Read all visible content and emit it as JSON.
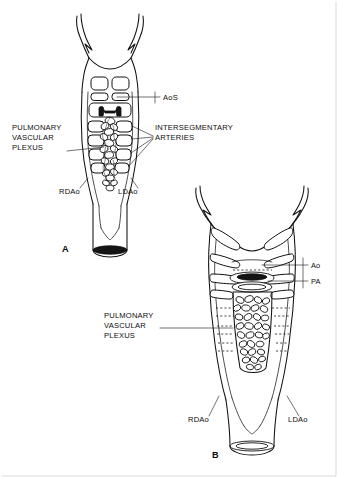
{
  "figure": {
    "type": "anatomical-line-diagram",
    "background_color": "#ffffff",
    "ink_color": "#101010",
    "width": 338,
    "height": 478
  },
  "panels": [
    {
      "id": "A",
      "letter": "A",
      "letter_x": 62,
      "letter_y": 252,
      "description": "Earlier stage: aortic sac with paired dorsal aortae and developing pulmonary vascular plexus",
      "labels": [
        {
          "name": "aortic-sac",
          "text": "AoS",
          "x": 163,
          "y": 100,
          "anchor": "start",
          "lines": [
            "AoS"
          ]
        },
        {
          "name": "pulmonary-vascular-plexus",
          "text": "PULMONARY VASCULAR PLEXUS",
          "x": 12,
          "y": 130,
          "anchor": "start",
          "lines": [
            "PULMONARY",
            "VASCULAR",
            "PLEXUS"
          ]
        },
        {
          "name": "intersegmentary-arteries",
          "text": "INTERSEGMENTARY ARTERIES",
          "x": 155,
          "y": 130,
          "anchor": "start",
          "lines": [
            "INTERSEGMENTARY",
            "ARTERIES"
          ]
        },
        {
          "name": "right-dorsal-aorta",
          "text": "RDAo",
          "x": 59,
          "y": 194,
          "anchor": "start",
          "lines": [
            "RDAo"
          ]
        },
        {
          "name": "left-dorsal-aorta",
          "text": "LDAo",
          "x": 118,
          "y": 194,
          "anchor": "start",
          "lines": [
            "LDAo"
          ]
        }
      ]
    },
    {
      "id": "B",
      "letter": "B",
      "letter_x": 212,
      "letter_y": 458,
      "description": "Later stage: separated aorta and pulmonary artery with enlarged pulmonary vascular plexus",
      "labels": [
        {
          "name": "aorta",
          "text": "Ao",
          "x": 311,
          "y": 265,
          "anchor": "start",
          "lines": [
            "Ao"
          ]
        },
        {
          "name": "pulmonary-artery",
          "text": "PA",
          "x": 311,
          "y": 281,
          "anchor": "start",
          "lines": [
            "PA"
          ]
        },
        {
          "name": "pulmonary-vascular-plexus",
          "text": "PULMONARY VASCULAR PLEXUS",
          "x": 104,
          "y": 318,
          "anchor": "start",
          "lines": [
            "PULMONARY",
            "VASCULAR",
            "PLEXUS"
          ]
        },
        {
          "name": "right-dorsal-aorta",
          "text": "RDAo",
          "x": 188,
          "y": 422,
          "anchor": "start",
          "lines": [
            "RDAo"
          ]
        },
        {
          "name": "left-dorsal-aorta",
          "text": "LDAo",
          "x": 288,
          "y": 422,
          "anchor": "start",
          "lines": [
            "LDAo"
          ]
        }
      ]
    }
  ],
  "abbreviations": {
    "AoS": "Aortic sac",
    "Ao": "Aorta",
    "PA": "Pulmonary artery",
    "RDAo": "Right dorsal aorta",
    "LDAo": "Left dorsal aorta"
  }
}
